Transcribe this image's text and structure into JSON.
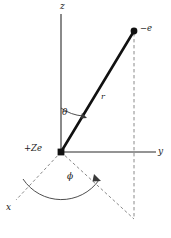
{
  "figure": {
    "background_color": "#ffffff",
    "line_color": "#1a1a1a",
    "dashed_color": "#8a8a8a",
    "axes": {
      "z_label": "z",
      "y_label": "y",
      "x_label": "x"
    },
    "labels": {
      "radius": "r",
      "polar_angle": "θ",
      "azimuthal_angle": "ϕ",
      "nucleus_charge": "+Ze",
      "electron_charge": "−e"
    },
    "points": {
      "origin": {
        "x": 61,
        "y": 152
      },
      "electron": {
        "x": 134,
        "y": 31
      },
      "projection": {
        "x": 134,
        "y": 219
      }
    }
  }
}
